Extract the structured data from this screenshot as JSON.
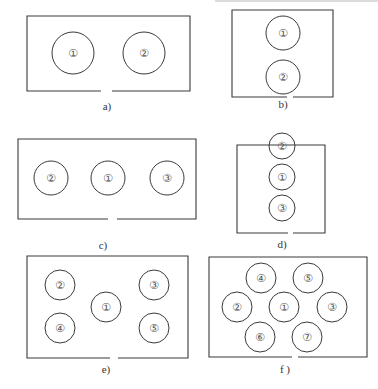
{
  "figure": {
    "stroke_color": "#3a3a3a",
    "panels": [
      {
        "id": "a",
        "label": "a)",
        "box": {
          "x": 27,
          "y": 16,
          "w": 163,
          "h": 75,
          "gap": [
            101,
            112
          ]
        },
        "label_pos": [
          107,
          110
        ],
        "circles": [
          {
            "num": "①",
            "cx": 73,
            "cy": 53,
            "r": 21
          },
          {
            "num": "②",
            "cx": 144,
            "cy": 53,
            "r": 21
          }
        ]
      },
      {
        "id": "b",
        "label": "b)",
        "box": {
          "x": 232,
          "y": 10,
          "w": 101,
          "h": 87,
          "gap": [
            287,
            293
          ]
        },
        "label_pos": [
          283,
          108
        ],
        "circles": [
          {
            "num": "①",
            "cx": 283,
            "cy": 33,
            "r": 17
          },
          {
            "num": "②",
            "cx": 283,
            "cy": 77,
            "r": 17
          }
        ]
      },
      {
        "id": "c",
        "label": "c)",
        "box": {
          "x": 18,
          "y": 139,
          "w": 178,
          "h": 80,
          "gap": [
            108,
            117
          ]
        },
        "label_pos": [
          103,
          249
        ],
        "circles": [
          {
            "num": "②",
            "cx": 51,
            "cy": 178,
            "r": 17
          },
          {
            "num": "①",
            "cx": 108,
            "cy": 178,
            "r": 17
          },
          {
            "num": "③",
            "cx": 167,
            "cy": 178,
            "r": 17
          }
        ]
      },
      {
        "id": "d",
        "label": "d)",
        "box": {
          "x": 237,
          "y": 145,
          "w": 88,
          "h": 88,
          "gap": [
            288,
            293
          ]
        },
        "label_pos": [
          282,
          248
        ],
        "circles": [
          {
            "num": "②",
            "cx": 282,
            "cy": 146,
            "r": 13
          },
          {
            "num": "①",
            "cx": 282,
            "cy": 177,
            "r": 13
          },
          {
            "num": "③",
            "cx": 282,
            "cy": 208,
            "r": 13
          }
        ]
      },
      {
        "id": "e",
        "label": "e)",
        "box": {
          "x": 27,
          "y": 256,
          "w": 161,
          "h": 102,
          "gap": [
            110,
            118
          ]
        },
        "label_pos": [
          106,
          373
        ],
        "circles": [
          {
            "num": "②",
            "cx": 60,
            "cy": 285,
            "r": 15
          },
          {
            "num": "③",
            "cx": 154,
            "cy": 285,
            "r": 15
          },
          {
            "num": "①",
            "cx": 106,
            "cy": 307,
            "r": 15
          },
          {
            "num": "④",
            "cx": 60,
            "cy": 328,
            "r": 15
          },
          {
            "num": "⑤",
            "cx": 154,
            "cy": 328,
            "r": 15
          }
        ]
      },
      {
        "id": "f",
        "label": "f )",
        "box": {
          "x": 209,
          "y": 257,
          "w": 158,
          "h": 100,
          "gap": [
            292,
            298
          ]
        },
        "label_pos": [
          285,
          373
        ],
        "circles": [
          {
            "num": "④",
            "cx": 261,
            "cy": 278,
            "r": 15
          },
          {
            "num": "⑤",
            "cx": 308,
            "cy": 278,
            "r": 15
          },
          {
            "num": "②",
            "cx": 237,
            "cy": 307,
            "r": 15
          },
          {
            "num": "①",
            "cx": 284,
            "cy": 307,
            "r": 15
          },
          {
            "num": "③",
            "cx": 332,
            "cy": 307,
            "r": 15
          },
          {
            "num": "⑥",
            "cx": 260,
            "cy": 337,
            "r": 15
          },
          {
            "num": "⑦",
            "cx": 307,
            "cy": 337,
            "r": 15
          }
        ]
      }
    ]
  }
}
